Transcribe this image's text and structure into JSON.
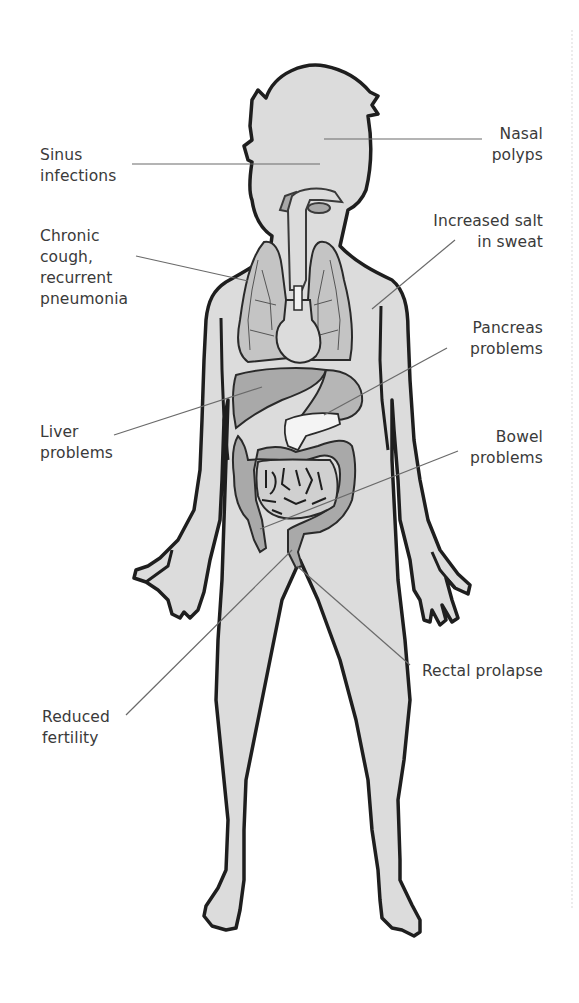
{
  "diagram": {
    "colors": {
      "background": "#ffffff",
      "body_fill": "#dcdcdc",
      "outline": "#1e1e1e",
      "organ_fill": "#a9a9a9",
      "lung_fill": "#c4c4c4",
      "pancreas_fill": "#f4f4f4",
      "leader_line": "#6a6a6a",
      "label_text": "#3a3a3a"
    },
    "labels": {
      "sinus": {
        "lines": [
          "Sinus",
          "infections"
        ],
        "side": "left",
        "target": "head/sinuses"
      },
      "nasal": {
        "lines": [
          "Nasal",
          "polyps"
        ],
        "side": "right",
        "target": "nose"
      },
      "cough": {
        "lines": [
          "Chronic",
          "cough,",
          "recurrent",
          "pneumonia"
        ],
        "side": "left",
        "target": "lungs"
      },
      "salt": {
        "lines": [
          "Increased salt",
          "in sweat"
        ],
        "side": "right",
        "target": "skin/arm"
      },
      "pancreas": {
        "lines": [
          "Pancreas",
          "problems"
        ],
        "side": "right",
        "target": "pancreas"
      },
      "liver": {
        "lines": [
          "Liver",
          "problems"
        ],
        "side": "left",
        "target": "liver"
      },
      "bowel": {
        "lines": [
          "Bowel",
          "problems"
        ],
        "side": "right",
        "target": "intestines"
      },
      "rectal": {
        "lines": [
          "Rectal prolapse"
        ],
        "side": "right",
        "target": "rectum"
      },
      "fertility": {
        "lines": [
          "Reduced",
          "fertility"
        ],
        "side": "left",
        "target": "reproductive organs"
      }
    }
  }
}
